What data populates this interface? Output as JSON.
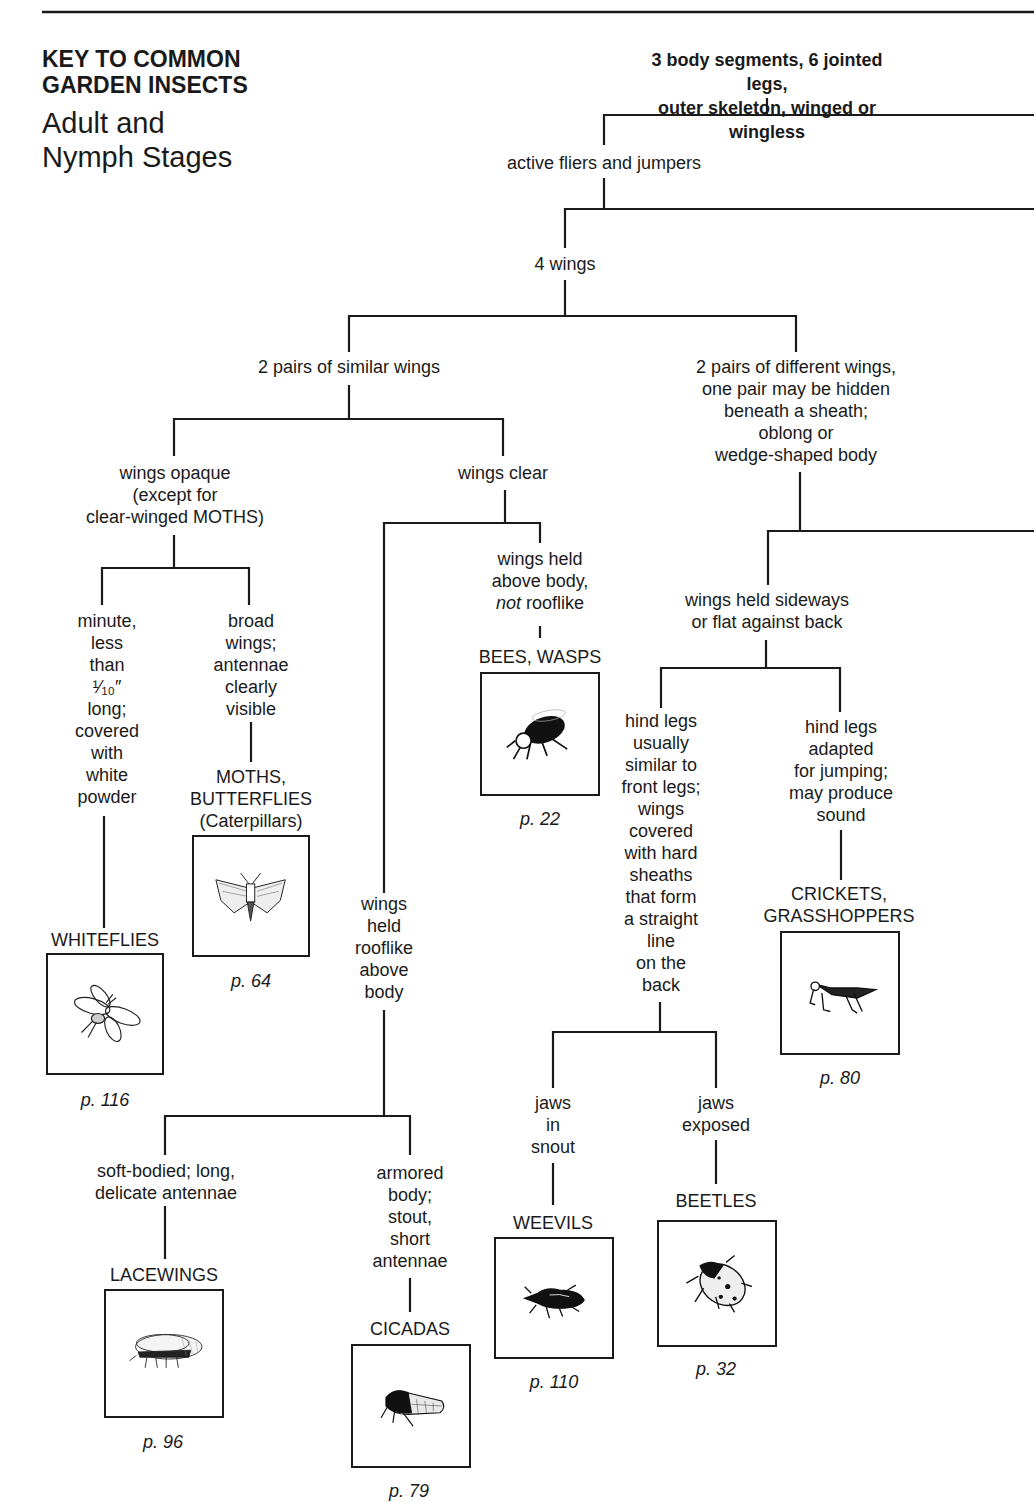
{
  "header": {
    "title_line1": "KEY TO COMMON",
    "title_line2": "GARDEN INSECTS",
    "subtitle_line1": "Adult and",
    "subtitle_line2": "Nymph Stages"
  },
  "nodes": {
    "root": "3 body segments, 6 jointed legs,\nouter skeleton, winged or wingless",
    "active": "active fliers and jumpers",
    "four_wings": "4 wings",
    "similar_wings": "2 pairs of similar wings",
    "different_wings": "2 pairs of different wings,\none pair may be hidden\nbeneath a sheath;\noblong or\nwedge-shaped body",
    "wings_opaque": "wings opaque\n(except for\nclear-winged MOTHS)",
    "wings_clear": "wings clear",
    "minute": "minute,\nless\nthan\n¹⁄₁₀″\nlong;\ncovered\nwith\nwhite\npowder",
    "broad_wings": "broad\nwings;\nantennae\nclearly\nvisible",
    "held_above_1": "wings held\nabove body,",
    "held_above_not": "not",
    "held_above_2": " rooflike",
    "rooflike": "wings\nheld\nrooflike\nabove\nbody",
    "sideways": "wings held sideways\nor flat against back",
    "hind_similar": "hind legs\nusually\nsimilar to\nfront legs;\nwings\ncovered\nwith hard\nsheaths\nthat form\na straight\nline\non the\nback",
    "hind_jumping": "hind legs\nadapted\nfor jumping;\nmay produce\nsound",
    "soft_bodied": "soft-bodied; long,\ndelicate antennae",
    "armored": "armored\nbody;\nstout,\nshort\nantennae",
    "jaws_snout": "jaws\nin\nsnout",
    "jaws_exposed": "jaws\nexposed"
  },
  "insects": [
    {
      "id": "whiteflies",
      "name": "WHITEFLIES",
      "page": "p. 116",
      "icon": "whitefly-icon"
    },
    {
      "id": "moths",
      "name": "MOTHS,\nBUTTERFLIES\n(Caterpillars)",
      "page": "p. 64",
      "icon": "moth-icon"
    },
    {
      "id": "bees",
      "name": "BEES, WASPS",
      "page": "p. 22",
      "icon": "bee-icon"
    },
    {
      "id": "crickets",
      "name": "CRICKETS,\nGRASSHOPPERS",
      "page": "p. 80",
      "icon": "grasshopper-icon"
    },
    {
      "id": "lacewings",
      "name": "LACEWINGS",
      "page": "p. 96",
      "icon": "lacewing-icon"
    },
    {
      "id": "cicadas",
      "name": "CICADAS",
      "page": "p. 79",
      "icon": "cicada-icon"
    },
    {
      "id": "weevils",
      "name": "WEEVILS",
      "page": "p. 110",
      "icon": "weevil-icon"
    },
    {
      "id": "beetles",
      "name": "BEETLES",
      "page": "p. 32",
      "icon": "beetle-icon"
    }
  ]
}
